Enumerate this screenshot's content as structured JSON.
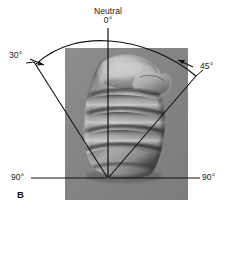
{
  "figure": {
    "panel_letter": "B",
    "background_color": "#ffffff",
    "photo_backdrop_color": "#878787"
  },
  "labels": {
    "neutral_title": "Neutral",
    "neutral_value": "0°",
    "left_angle": "30°",
    "right_angle": "45°",
    "left_extreme": "90°",
    "right_extreme": "90°"
  },
  "annotations": {
    "line_color": "#111111",
    "arc_description": "range-of-motion arc spanning from left 30 degrees through neutral 0 degrees to right 45 degrees",
    "pivot_description": "radiating measurement lines converge at the wrist pivot point"
  }
}
